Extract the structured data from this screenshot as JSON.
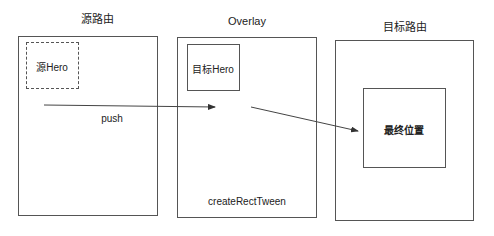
{
  "diagram": {
    "source_route": {
      "title": "源路由",
      "hero_label": "源Hero"
    },
    "overlay": {
      "title": "Overlay",
      "hero_label": "目标Hero",
      "tween_label": "createRectTween"
    },
    "target_route": {
      "title": "目标路由",
      "final_label": "最终位置"
    },
    "arrows": [
      {
        "from": "源Hero",
        "to": "目标Hero",
        "label": "push"
      },
      {
        "from": "目标Hero",
        "to": "最终位置",
        "label": ""
      }
    ],
    "colors": {
      "stroke": "#555555",
      "text": "#222222",
      "background": "#ffffff"
    }
  }
}
